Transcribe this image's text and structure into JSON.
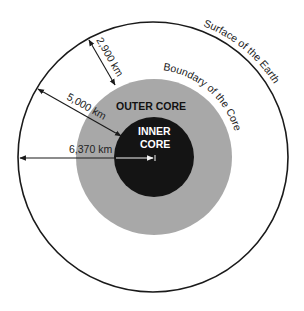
{
  "diagram": {
    "title": "",
    "colors": {
      "background": "#ffffff",
      "surface_line": "#1a1a1a",
      "outer_core": "#a8a8a8",
      "inner_core": "#141414",
      "arrow": "#1a1a1a",
      "arrow_on_dark": "#f2f2f2",
      "text_dark": "#1e1e1e",
      "text_light": "#ffffff"
    },
    "layers": [
      {
        "id": "earth",
        "label": "Surface of the Earth",
        "radius_km": 6370
      },
      {
        "id": "outer_core",
        "label": "OUTER CORE",
        "boundary_label": "Boundary of the Core",
        "radius_km": 3470
      },
      {
        "id": "inner_core",
        "label_line1": "INNER",
        "label_line2": "CORE"
      }
    ],
    "measurements": {
      "crust_mantle_depth": "2,900 km",
      "core_boundary_depth": "5,000 km",
      "earth_radius": "6,370 km"
    },
    "labels": {
      "surface": "Surface of the Earth",
      "boundary": "Boundary of the Core",
      "outer_core": "OUTER CORE",
      "inner_core_1": "INNER",
      "inner_core_2": "CORE",
      "m1": "2,900 km",
      "m2": "5,000 km",
      "m3": "6,370 km"
    }
  }
}
